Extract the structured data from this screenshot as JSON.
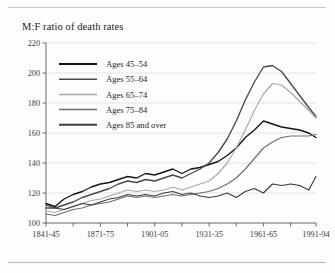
{
  "figure": {
    "title": "M:F ratio of death rates"
  },
  "chart_data": {
    "type": "line",
    "title": "M:F ratio of death rates",
    "xlabel": "",
    "ylabel": "",
    "ylim": [
      100,
      220
    ],
    "yticks": [
      100,
      120,
      140,
      160,
      180,
      200,
      220
    ],
    "xlim": [
      1843,
      1992
    ],
    "xticks": [
      "1841-45",
      "1871-75",
      "1901-05",
      "1931-35",
      "1961-65",
      "1991-94"
    ],
    "xtick_values": [
      1843,
      1873,
      1903,
      1933,
      1963,
      1992
    ],
    "minor_tick_interval_years": 15,
    "grid": "horizontal",
    "legend_position": "upper-left-inside",
    "x": [
      1843,
      1848,
      1853,
      1858,
      1863,
      1868,
      1873,
      1878,
      1883,
      1888,
      1893,
      1898,
      1903,
      1908,
      1913,
      1918,
      1923,
      1928,
      1933,
      1938,
      1943,
      1948,
      1953,
      1958,
      1963,
      1968,
      1973,
      1978,
      1983,
      1988,
      1992
    ],
    "series": [
      {
        "name": "Ages 45-54",
        "color": "#141414",
        "values": [
          113,
          111,
          116,
          119,
          121,
          124,
          126,
          127,
          129,
          131,
          130,
          133,
          132,
          134,
          136,
          133,
          136,
          137,
          139,
          141,
          145,
          150,
          157,
          162,
          168,
          166,
          164,
          163,
          162,
          160,
          157
        ]
      },
      {
        "name": "Ages 55-64",
        "color": "#4a4a4a",
        "values": [
          110,
          110,
          112,
          114,
          117,
          119,
          121,
          123,
          126,
          128,
          127,
          129,
          128,
          130,
          132,
          130,
          133,
          136,
          140,
          147,
          156,
          168,
          182,
          194,
          204,
          205,
          201,
          193,
          185,
          177,
          171
        ]
      },
      {
        "name": "Ages 65-74",
        "color": "#a8a8a8",
        "values": [
          108,
          107,
          109,
          111,
          113,
          115,
          116,
          118,
          120,
          122,
          121,
          122,
          121,
          122,
          124,
          122,
          124,
          126,
          128,
          133,
          140,
          150,
          162,
          175,
          186,
          193,
          192,
          187,
          181,
          175,
          170
        ]
      },
      {
        "name": "Ages 75-84",
        "color": "#6e6e6e",
        "values": [
          106,
          105,
          107,
          109,
          110,
          112,
          113,
          114,
          116,
          118,
          117,
          118,
          117,
          118,
          119,
          118,
          119,
          120,
          121,
          123,
          126,
          130,
          136,
          143,
          150,
          154,
          157,
          158,
          158,
          158,
          159
        ]
      },
      {
        "name": "Ages 85 and over",
        "color": "#3c3c3c",
        "values": [
          112,
          110,
          109,
          111,
          113,
          112,
          114,
          116,
          117,
          119,
          118,
          119,
          118,
          120,
          121,
          119,
          120,
          118,
          117,
          118,
          120,
          117,
          121,
          123,
          120,
          126,
          125,
          126,
          125,
          122,
          131
        ]
      }
    ]
  }
}
